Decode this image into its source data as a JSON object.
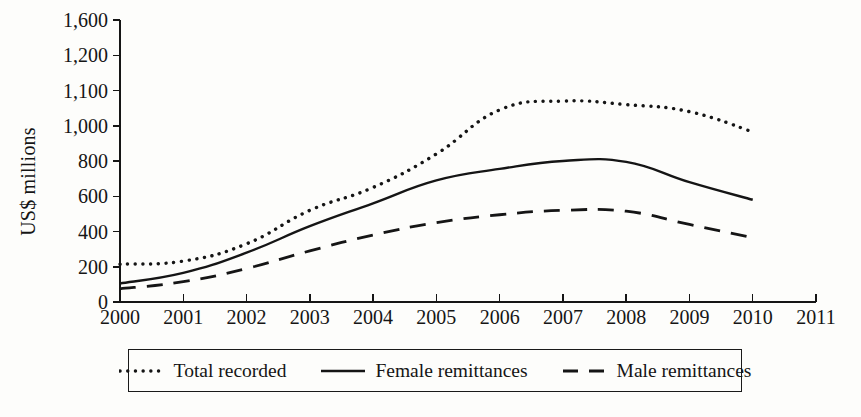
{
  "chart_data": {
    "type": "line",
    "title": "",
    "xlabel": "",
    "ylabel": "US$ millions",
    "x": [
      2000,
      2001,
      2002,
      2003,
      2004,
      2005,
      2006,
      2007,
      2008,
      2009,
      2010
    ],
    "xlim": [
      2000,
      2011
    ],
    "ylim": [
      0,
      1600
    ],
    "grid": false,
    "legend_position": "bottom",
    "y_tick_labels": [
      "1,600",
      "1,200",
      "1,100",
      "1,000",
      "800",
      "600",
      "400",
      "200",
      "0"
    ],
    "y_tick_values": [
      1600,
      1400,
      1200,
      1000,
      800,
      600,
      400,
      200,
      0
    ],
    "x_tick_labels": [
      "2000",
      "2001",
      "2002",
      "2003",
      "2004",
      "2005",
      "2006",
      "2007",
      "2008",
      "2009",
      "2010",
      "2011"
    ],
    "series": [
      {
        "name": "Total recorded",
        "style": "dotted",
        "values": [
          215,
          232,
          330,
          520,
          650,
          840,
          1090,
          1140,
          1120,
          1080,
          965
        ]
      },
      {
        "name": "Female remittances",
        "style": "solid",
        "values": [
          105,
          165,
          280,
          430,
          560,
          690,
          755,
          800,
          795,
          680,
          580
        ]
      },
      {
        "name": "Male remittances",
        "style": "dashed",
        "values": [
          75,
          115,
          190,
          290,
          380,
          450,
          495,
          520,
          515,
          440,
          365
        ]
      }
    ]
  },
  "legend": {
    "items": [
      {
        "label": "Total recorded",
        "style": "dotted"
      },
      {
        "label": "Female remittances",
        "style": "solid"
      },
      {
        "label": "Male remittances",
        "style": "dashed"
      }
    ]
  },
  "colors": {
    "ink": "#151515",
    "background": "#fdfdfb"
  }
}
